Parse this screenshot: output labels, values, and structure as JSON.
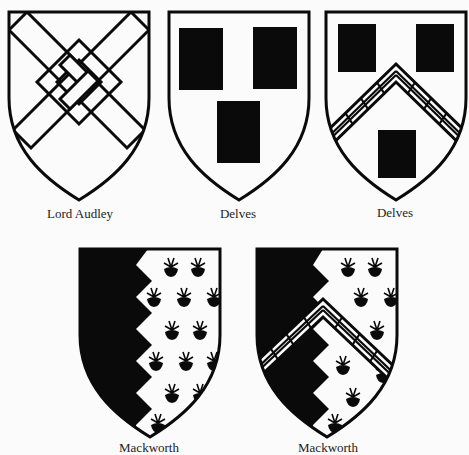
{
  "colors": {
    "ink": "#0a0a0a",
    "field": "#fbfbfb",
    "background": "#fbfbfb"
  },
  "shields": [
    {
      "label": "Lord Audley",
      "blazon": "fret",
      "tinctures": [
        "argent",
        "fret sable-outlined"
      ]
    },
    {
      "label": "Delves",
      "blazon": "three billets",
      "tinctures": [
        "argent",
        "sable"
      ]
    },
    {
      "label": "Delves",
      "blazon": "chevron fretty between three billets",
      "tinctures": [
        "argent",
        "sable"
      ]
    },
    {
      "label": "Mackworth",
      "blazon": "per pale indented, ermine (crescent-like tufts) sinister",
      "tinctures": [
        "sable",
        "ermine"
      ]
    },
    {
      "label": "Mackworth",
      "blazon": "per pale indented with chevron fretty",
      "tinctures": [
        "sable",
        "ermine"
      ]
    }
  ]
}
